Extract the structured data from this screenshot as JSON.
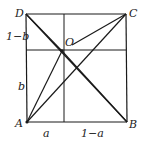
{
  "diagram": {
    "points": {
      "A": {
        "label": "A",
        "x": 27,
        "y": 122
      },
      "B": {
        "label": "B",
        "x": 127,
        "y": 122
      },
      "C": {
        "label": "C",
        "x": 126,
        "y": 14
      },
      "D": {
        "label": "D",
        "x": 26,
        "y": 14
      },
      "O": {
        "label": "O",
        "x": 62,
        "y": 51
      }
    },
    "segment_labels": {
      "a": "a",
      "one_minus_a": "1−a",
      "b": "b",
      "one_minus_b": "1−b"
    },
    "segments": [
      "AB",
      "BC",
      "CD",
      "DA",
      "DB",
      "DO",
      "OB",
      "AO",
      "AC",
      "OC",
      "vertical-divider",
      "horizontal-divider"
    ],
    "colors": {
      "line": "#1a1a1a",
      "background": "#ffffff"
    }
  }
}
